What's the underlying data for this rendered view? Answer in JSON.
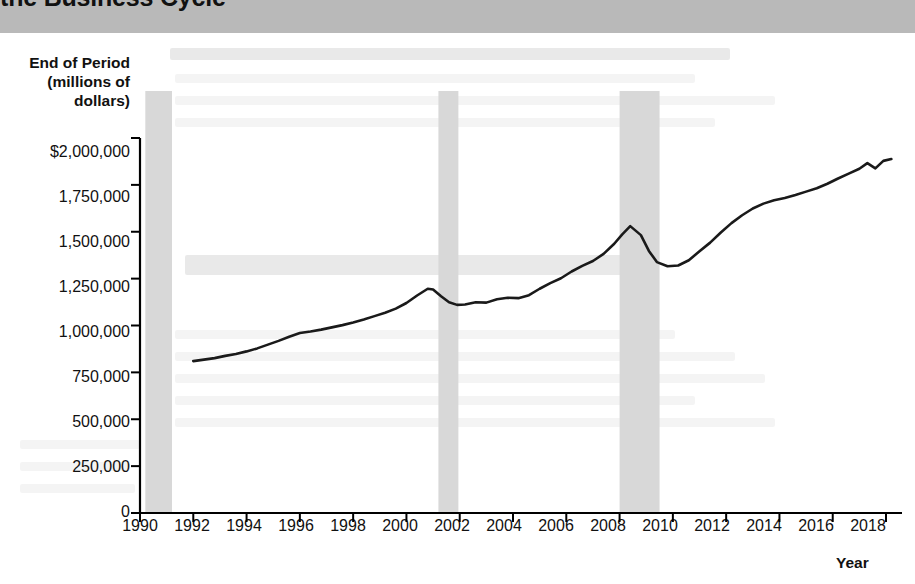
{
  "header": {
    "title_partial": "...the Business Cycle",
    "title_visible": "the Business Cycle",
    "strip_color": "#b9b9b9"
  },
  "colors": {
    "line": "#1a1a1a",
    "recession_band": "#d8d8d8",
    "axis": "#000000",
    "background": "#ffffff"
  },
  "chart_data": {
    "type": "line",
    "title": "the Business Cycle",
    "xlabel": "Year",
    "ylabel": "End of Period\n(millions of\ndollars)",
    "ylabel_lines": [
      "End of Period",
      "(millions of",
      "dollars)"
    ],
    "xlim": [
      1990,
      2018.6
    ],
    "ylim": [
      0,
      2000000
    ],
    "grid": false,
    "legend": null,
    "ytick_labels": [
      "$2,000,000",
      "1,750,000",
      "1,500,000",
      "1,250,000",
      "1,000,000",
      "750,000",
      "500,000",
      "250,000",
      "0"
    ],
    "ytick_values": [
      2000000,
      1750000,
      1500000,
      1250000,
      1000000,
      750000,
      500000,
      250000,
      0
    ],
    "xtick_labels": [
      "1990",
      "1992",
      "1994",
      "1996",
      "1998",
      "2000",
      "2002",
      "2004",
      "2006",
      "2008",
      "2010",
      "2012",
      "2014",
      "2016",
      "2018"
    ],
    "xtick_values": [
      1990,
      1992,
      1994,
      1996,
      1998,
      2000,
      2002,
      2004,
      2006,
      2008,
      2010,
      2012,
      2014,
      2016,
      2018
    ],
    "shaded_regions": [
      {
        "name": "recession-1990-1991",
        "x0": 1990.2,
        "x1": 1991.2,
        "label": "Recession"
      },
      {
        "name": "recession-2001",
        "x0": 2001.2,
        "x1": 2001.95,
        "label": "Recession"
      },
      {
        "name": "recession-2008-2009",
        "x0": 2008.0,
        "x1": 2009.5,
        "label": "Recession"
      }
    ],
    "series": [
      {
        "name": "End of Period",
        "x": [
          1992.0,
          1992.4,
          1992.8,
          1993.2,
          1993.6,
          1994.0,
          1994.4,
          1994.8,
          1995.2,
          1995.6,
          1996.0,
          1996.4,
          1996.8,
          1997.2,
          1997.6,
          1998.0,
          1998.4,
          1998.8,
          1999.2,
          1999.6,
          2000.0,
          2000.4,
          2000.8,
          2001.0,
          2001.3,
          2001.6,
          2001.9,
          2002.2,
          2002.6,
          2003.0,
          2003.4,
          2003.8,
          2004.2,
          2004.6,
          2005.0,
          2005.4,
          2005.8,
          2006.2,
          2006.6,
          2007.0,
          2007.4,
          2007.8,
          2008.1,
          2008.4,
          2008.8,
          2009.1,
          2009.4,
          2009.8,
          2010.2,
          2010.6,
          2011.0,
          2011.4,
          2011.8,
          2012.2,
          2012.6,
          2013.0,
          2013.4,
          2013.8,
          2014.2,
          2014.6,
          2015.0,
          2015.4,
          2015.8,
          2016.2,
          2016.6,
          2017.0,
          2017.3,
          2017.6,
          2017.9,
          2018.2
        ],
        "y": [
          810000,
          818000,
          826000,
          838000,
          848000,
          862000,
          878000,
          898000,
          918000,
          940000,
          960000,
          968000,
          978000,
          990000,
          1002000,
          1016000,
          1032000,
          1050000,
          1068000,
          1090000,
          1120000,
          1160000,
          1196000,
          1192000,
          1156000,
          1124000,
          1110000,
          1112000,
          1124000,
          1122000,
          1140000,
          1148000,
          1146000,
          1162000,
          1196000,
          1226000,
          1252000,
          1288000,
          1318000,
          1344000,
          1382000,
          1436000,
          1486000,
          1530000,
          1482000,
          1398000,
          1338000,
          1316000,
          1320000,
          1348000,
          1396000,
          1442000,
          1496000,
          1546000,
          1588000,
          1624000,
          1650000,
          1668000,
          1680000,
          1696000,
          1714000,
          1732000,
          1756000,
          1784000,
          1810000,
          1836000,
          1866000,
          1838000,
          1878000,
          1888000
        ]
      }
    ]
  },
  "bleed_text_note": "faint reversed text from opposite page"
}
